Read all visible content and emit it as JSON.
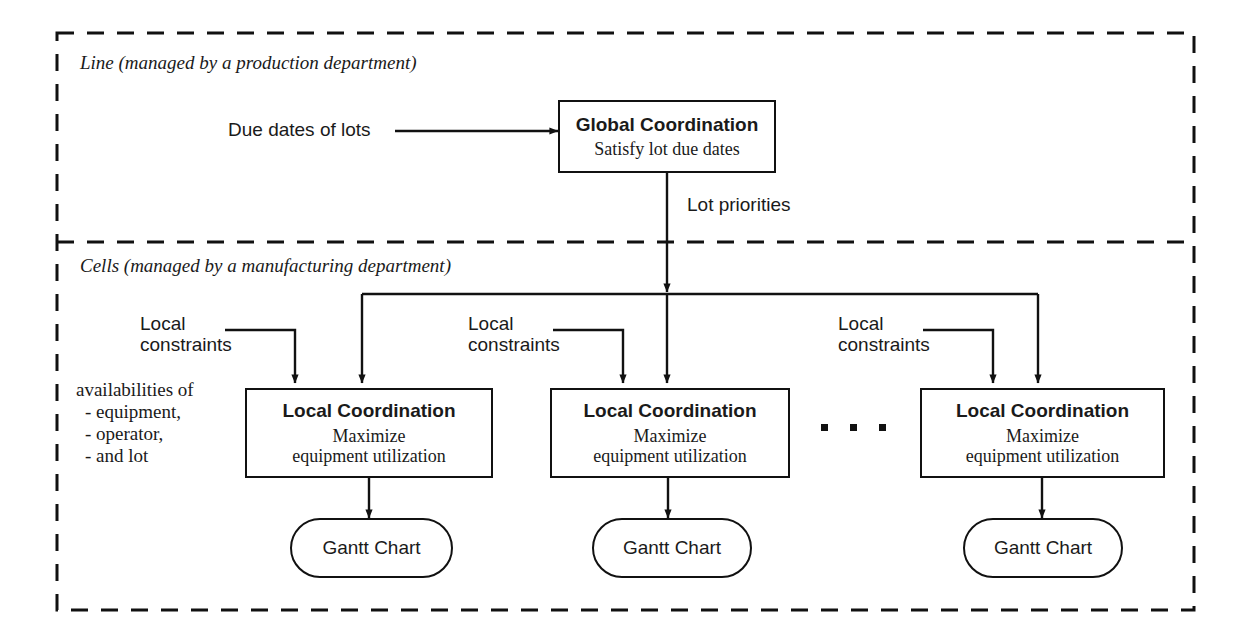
{
  "diagram": {
    "sections": [
      {
        "id": "line",
        "label": "Line (managed by a production department)"
      },
      {
        "id": "cells",
        "label": "Cells (managed by a manufacturing department)"
      }
    ],
    "global_node": {
      "title": "Global Coordination",
      "subtitle": "Satisfy lot due dates"
    },
    "inputs": {
      "due_dates": "Due dates of lots",
      "lot_priorities": "Lot priorities",
      "local_constraints": "Local\nconstraints",
      "availabilities_heading": "availabilities of",
      "availabilities_items": [
        "- equipment,",
        "- operator,",
        "- and lot"
      ]
    },
    "local_nodes": [
      {
        "title": "Local Coordination",
        "subtitle_line1": "Maximize",
        "subtitle_line2": "equipment utilization"
      },
      {
        "title": "Local Coordination",
        "subtitle_line1": "Maximize",
        "subtitle_line2": "equipment utilization"
      },
      {
        "title": "Local Coordination",
        "subtitle_line1": "Maximize",
        "subtitle_line2": "equipment utilization"
      }
    ],
    "outputs": [
      {
        "label": "Gantt Chart"
      },
      {
        "label": "Gantt Chart"
      },
      {
        "label": "Gantt Chart"
      }
    ],
    "ellipsis": "· · ·",
    "colors": {
      "ink": "#111111",
      "background": "#ffffff",
      "border": "#111111"
    }
  }
}
